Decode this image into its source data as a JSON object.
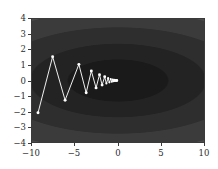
{
  "figure": {
    "title": "",
    "background": "#ffffff",
    "frame_color": "#3a3a3a"
  },
  "axes": {
    "xlabel": "",
    "ylabel": "",
    "xlim": [
      -10,
      10
    ],
    "ylim": [
      -4,
      4
    ],
    "xticks": [
      -10,
      -5,
      0,
      5,
      10
    ],
    "xtick_labels": [
      "−10",
      "−5",
      "0",
      "5",
      "10"
    ],
    "yticks": [
      -4,
      -3,
      -2,
      -1,
      0,
      1,
      2,
      3,
      4
    ],
    "ytick_labels": [
      "−4",
      "−3",
      "−2",
      "−1",
      "0",
      "1",
      "2",
      "3",
      "4"
    ],
    "grid": false
  },
  "chart_data": {
    "type": "line",
    "title": "",
    "xlabel": "",
    "ylabel": "",
    "xlim": [
      -10,
      10
    ],
    "ylim": [
      -4,
      4
    ],
    "grid": false,
    "legend": "none",
    "background_type": "filled-contour",
    "contour": {
      "description": "Elliptical quadratic bowl contours, grayscale, dark at minimum near (0,0)",
      "center": [
        0.0,
        0.0
      ],
      "x_semi_axis_scale": 1.0,
      "y_semi_axis_scale": 0.38,
      "levels": [
        0.08,
        0.18,
        0.3,
        0.44,
        0.6,
        0.78,
        1.0
      ],
      "colors": [
        "#1a1a1a",
        "#232323",
        "#2e2e2e",
        "#3b3b3b",
        "#4c4c4c",
        "#5f5f5f",
        "#7a7a7a",
        "#9a9a9a"
      ]
    },
    "series": [
      {
        "name": "zigzag-descent-path",
        "color": "#f2f2f2",
        "marker": "o",
        "marker_color": "#ffffff",
        "linewidth": 1,
        "x": [
          -9.3,
          -7.6,
          -6.15,
          -4.55,
          -3.7,
          -3.1,
          -2.55,
          -2.15,
          -1.85,
          -1.55,
          -1.35,
          -1.15,
          -1.0,
          -0.85,
          -0.72,
          -0.62,
          -0.52,
          -0.45,
          -0.38,
          -0.32,
          -0.27,
          -0.22,
          -0.18,
          -0.15,
          -0.12,
          -0.1
        ],
        "y": [
          -2.1,
          1.55,
          -1.28,
          1.05,
          -0.8,
          0.62,
          -0.48,
          0.38,
          -0.3,
          0.24,
          -0.19,
          0.15,
          -0.12,
          0.1,
          -0.08,
          0.06,
          -0.05,
          0.04,
          -0.03,
          0.025,
          -0.02,
          0.016,
          -0.013,
          0.01,
          -0.008,
          0.006
        ]
      }
    ]
  }
}
